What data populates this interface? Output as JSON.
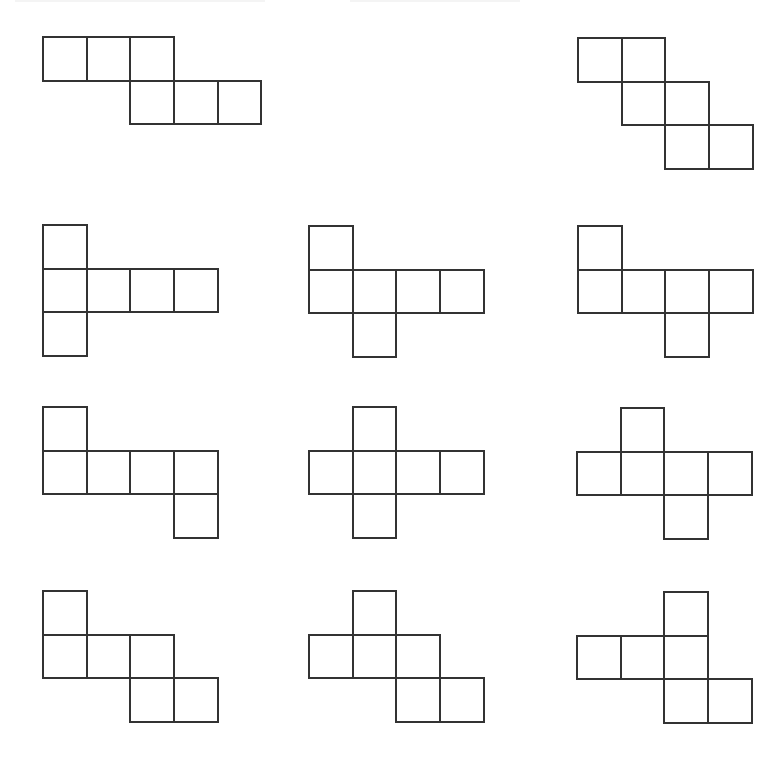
{
  "figure": {
    "type": "cube-nets",
    "cell_size": 43.7,
    "stroke_color": "#333333",
    "background": "#ffffff",
    "net_count": 11
  },
  "nets": [
    {
      "id": "net-1",
      "origin": [
        42,
        36
      ],
      "cells": [
        [
          0,
          0
        ],
        [
          1,
          0
        ],
        [
          2,
          0
        ],
        [
          2,
          1
        ],
        [
          3,
          1
        ],
        [
          4,
          1
        ]
      ]
    },
    {
      "id": "net-2",
      "origin": [
        577,
        37
      ],
      "cells": [
        [
          0,
          0
        ],
        [
          1,
          0
        ],
        [
          1,
          1
        ],
        [
          2,
          1
        ],
        [
          2,
          2
        ],
        [
          3,
          2
        ]
      ]
    },
    {
      "id": "net-3",
      "origin": [
        42,
        224
      ],
      "cells": [
        [
          0,
          0
        ],
        [
          0,
          1
        ],
        [
          1,
          1
        ],
        [
          2,
          1
        ],
        [
          3,
          1
        ],
        [
          0,
          2
        ]
      ]
    },
    {
      "id": "net-4",
      "origin": [
        308,
        225
      ],
      "cells": [
        [
          0,
          0
        ],
        [
          0,
          1
        ],
        [
          1,
          1
        ],
        [
          2,
          1
        ],
        [
          3,
          1
        ],
        [
          1,
          2
        ]
      ]
    },
    {
      "id": "net-5",
      "origin": [
        577,
        225
      ],
      "cells": [
        [
          0,
          0
        ],
        [
          0,
          1
        ],
        [
          1,
          1
        ],
        [
          2,
          1
        ],
        [
          3,
          1
        ],
        [
          2,
          2
        ]
      ]
    },
    {
      "id": "net-6",
      "origin": [
        42,
        406
      ],
      "cells": [
        [
          0,
          0
        ],
        [
          0,
          1
        ],
        [
          1,
          1
        ],
        [
          2,
          1
        ],
        [
          3,
          1
        ],
        [
          3,
          2
        ]
      ]
    },
    {
      "id": "net-7",
      "origin": [
        308,
        406
      ],
      "cells": [
        [
          1,
          0
        ],
        [
          0,
          1
        ],
        [
          1,
          1
        ],
        [
          2,
          1
        ],
        [
          3,
          1
        ],
        [
          1,
          2
        ]
      ]
    },
    {
      "id": "net-8",
      "origin": [
        576,
        407
      ],
      "cells": [
        [
          1,
          0
        ],
        [
          0,
          1
        ],
        [
          1,
          1
        ],
        [
          2,
          1
        ],
        [
          3,
          1
        ],
        [
          2,
          2
        ]
      ]
    },
    {
      "id": "net-9",
      "origin": [
        42,
        590
      ],
      "cells": [
        [
          0,
          0
        ],
        [
          0,
          1
        ],
        [
          1,
          1
        ],
        [
          2,
          1
        ],
        [
          2,
          2
        ],
        [
          3,
          2
        ]
      ]
    },
    {
      "id": "net-10",
      "origin": [
        308,
        590
      ],
      "cells": [
        [
          1,
          0
        ],
        [
          0,
          1
        ],
        [
          1,
          1
        ],
        [
          2,
          1
        ],
        [
          2,
          2
        ],
        [
          3,
          2
        ]
      ]
    },
    {
      "id": "net-11",
      "origin": [
        576,
        591
      ],
      "cells": [
        [
          2,
          0
        ],
        [
          0,
          1
        ],
        [
          1,
          1
        ],
        [
          2,
          1
        ],
        [
          2,
          2
        ],
        [
          3,
          2
        ]
      ]
    }
  ]
}
